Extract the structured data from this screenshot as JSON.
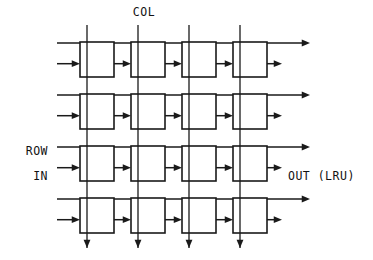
{
  "diagram": {
    "type": "systolic-array-grid",
    "title_visible": false,
    "background_color": "#ffffff",
    "line_color": "#1a1a1a",
    "labels": {
      "col": "COL",
      "row": "ROW",
      "in": "IN",
      "out": "OUT (LRU)"
    },
    "grid": {
      "rows": 4,
      "cols": 4,
      "cell_width": 34,
      "cell_height": 35,
      "col_pitch": 51,
      "row_pitch": 52,
      "origin_x": 80,
      "origin_y": 42
    },
    "label_positions": {
      "col": {
        "x": 144,
        "y": 16
      },
      "row": {
        "x": 48,
        "y": 155
      },
      "in": {
        "x": 48,
        "y": 180
      },
      "out": {
        "x": 288,
        "y": 180
      }
    },
    "geometry": {
      "col_line_top_y": 25,
      "col_line_bottom_y": 248,
      "row_line_left_x": 57,
      "row_line_right_x": 310,
      "out_arrow_right_x": 282,
      "in_arrow_start_x": 57,
      "link_arrow_length": 16
    },
    "cells": [
      {
        "row": 0,
        "col": 0,
        "name": "cell-r0c0"
      },
      {
        "row": 0,
        "col": 1,
        "name": "cell-r0c1"
      },
      {
        "row": 0,
        "col": 2,
        "name": "cell-r0c2"
      },
      {
        "row": 0,
        "col": 3,
        "name": "cell-r0c3"
      },
      {
        "row": 1,
        "col": 0,
        "name": "cell-r1c0"
      },
      {
        "row": 1,
        "col": 1,
        "name": "cell-r1c1"
      },
      {
        "row": 1,
        "col": 2,
        "name": "cell-r1c2"
      },
      {
        "row": 1,
        "col": 3,
        "name": "cell-r1c3"
      },
      {
        "row": 2,
        "col": 0,
        "name": "cell-r2c0"
      },
      {
        "row": 2,
        "col": 1,
        "name": "cell-r2c1"
      },
      {
        "row": 2,
        "col": 2,
        "name": "cell-r2c2"
      },
      {
        "row": 2,
        "col": 3,
        "name": "cell-r2c3"
      },
      {
        "row": 3,
        "col": 0,
        "name": "cell-r3c0"
      },
      {
        "row": 3,
        "col": 1,
        "name": "cell-r3c1"
      },
      {
        "row": 3,
        "col": 2,
        "name": "cell-r3c2"
      },
      {
        "row": 3,
        "col": 3,
        "name": "cell-r3c3"
      }
    ]
  }
}
